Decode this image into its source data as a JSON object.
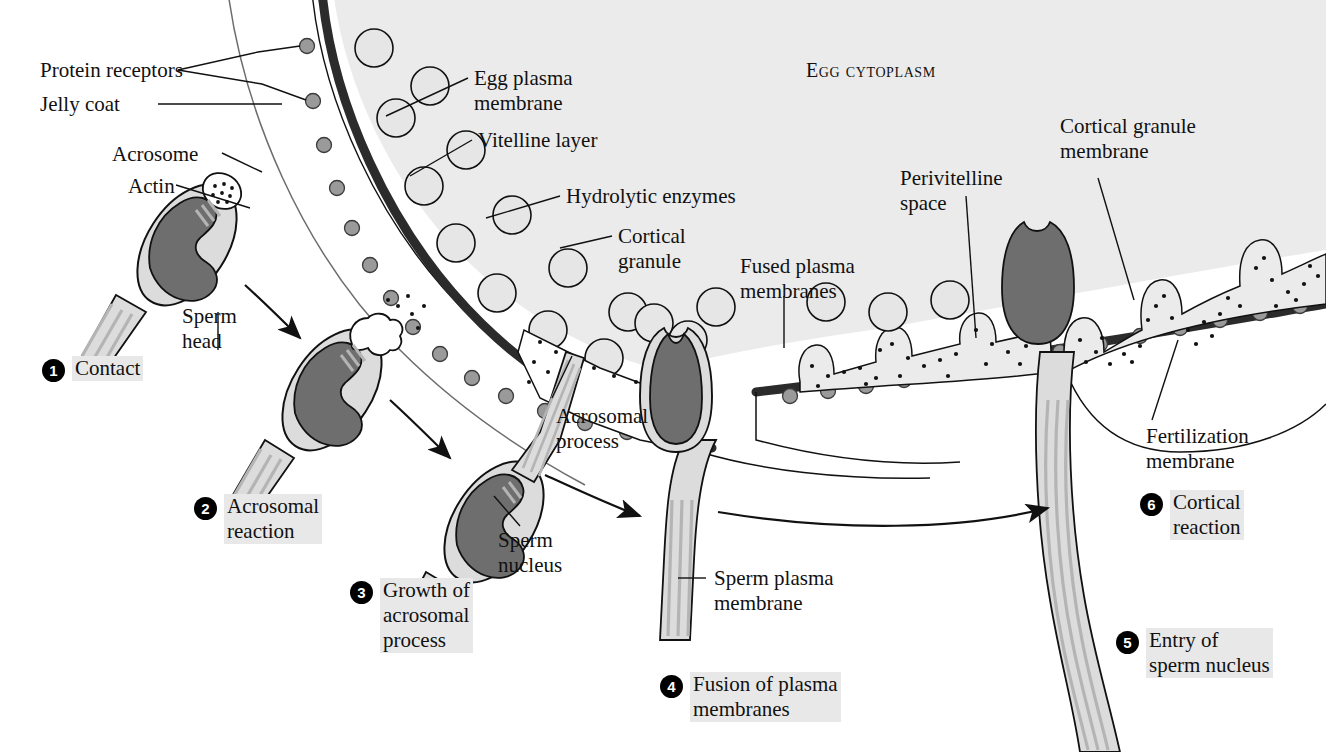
{
  "figure": {
    "region_label": "Egg cytoplasm"
  },
  "colors": {
    "cytoplasm": "#ebebeb",
    "plasma_membrane": "#2b2b2b",
    "receptor": "#9a9a9a",
    "sperm_body": "#dcdcdc",
    "sperm_nucleus": "#6e6e6e",
    "tail_stripe": "#b4b4b4",
    "granule_fill": "#e4e4e4",
    "label_highlight": "#e8e8e8",
    "outline": "#111111",
    "page_background": "#ffffff"
  },
  "callouts": [
    {
      "id": "protein-receptors",
      "text": "Protein receptors"
    },
    {
      "id": "jelly-coat",
      "text": "Jelly coat"
    },
    {
      "id": "acrosome",
      "text": "Acrosome"
    },
    {
      "id": "actin",
      "text": "Actin"
    },
    {
      "id": "sperm-head",
      "text": "Sperm\nhead"
    },
    {
      "id": "egg-plasma-membrane",
      "text": "Egg plasma\nmembrane"
    },
    {
      "id": "vitelline-layer",
      "text": "Vitelline layer"
    },
    {
      "id": "hydrolytic-enzymes",
      "text": "Hydrolytic enzymes"
    },
    {
      "id": "cortical-granule",
      "text": "Cortical\ngranule"
    },
    {
      "id": "acrosomal-process",
      "text": "Acrosomal\nprocess"
    },
    {
      "id": "sperm-nucleus",
      "text": "Sperm\nnucleus"
    },
    {
      "id": "fused-plasma-membranes",
      "text": "Fused plasma\nmembranes"
    },
    {
      "id": "sperm-plasma-membrane",
      "text": "Sperm plasma\nmembrane"
    },
    {
      "id": "perivitelline-space",
      "text": "Perivitelline\nspace"
    },
    {
      "id": "cortical-granule-membrane",
      "text": "Cortical granule\nmembrane"
    },
    {
      "id": "fertilization-membrane",
      "text": "Fertilization\nmembrane"
    }
  ],
  "steps": [
    {
      "number": "1",
      "label": "Contact"
    },
    {
      "number": "2",
      "label": "Acrosomal\nreaction"
    },
    {
      "number": "3",
      "label": "Growth of\nacrosomal\nprocess"
    },
    {
      "number": "4",
      "label": "Fusion of plasma\nmembranes"
    },
    {
      "number": "5",
      "label": "Entry of\nsperm nucleus"
    },
    {
      "number": "6",
      "label": "Cortical\nreaction"
    }
  ]
}
